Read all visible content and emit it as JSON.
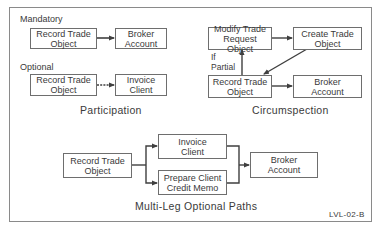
{
  "participation": {
    "caption": "Participation",
    "mandatory": {
      "label": "Mandatory",
      "source": "Record Trade\nObject",
      "target": "Broker\nAccount"
    },
    "optional": {
      "label": "Optional",
      "source": "Record Trade\nObject",
      "target": "Invoice\nClient"
    }
  },
  "circumspection": {
    "caption": "Circumspection",
    "modify": "Modify Trade\nRequest Object",
    "create": "Create Trade\nObject",
    "record": "Record Trade\nObject",
    "broker": "Broker\nAccount",
    "condition_label": "If\nPartial"
  },
  "multi_leg": {
    "caption": "Multi-Leg Optional Paths",
    "record": "Record Trade\nObject",
    "invoice": "Invoice\nClient",
    "prepare": "Prepare Client\nCredit Memo",
    "broker": "Broker\nAccount"
  },
  "figure_code": "LVL-02-B",
  "colors": {
    "line": "#3f3f3f",
    "box_border": "#6e6e6e",
    "frame": "#8a8a8a",
    "text": "#3a3a3a"
  }
}
